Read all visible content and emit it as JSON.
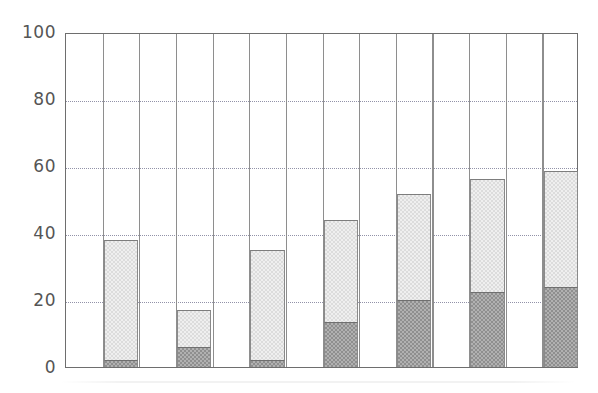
{
  "chart_data": {
    "type": "bar",
    "subtype": "stacked-vertical",
    "title": "",
    "subtitle": "",
    "xlabel": "",
    "ylabel": "",
    "categories": [
      "1",
      "2",
      "3",
      "4",
      "5",
      "6",
      "7"
    ],
    "x_tick_labels": [],
    "y_tick_labels": [
      "0",
      "20",
      "40",
      "60",
      "80",
      "100"
    ],
    "y_tick_values": [
      0,
      20,
      40,
      60,
      80,
      100
    ],
    "ylim": [
      0,
      100
    ],
    "grid": {
      "horizontal": true,
      "horizontal_style": "dotted",
      "vertical": true,
      "vertical_style": "solid",
      "vertical_separator_count": 14
    },
    "legend": {
      "visible": false,
      "position": "none",
      "entries": []
    },
    "annotations": [],
    "series": [
      {
        "name": "lower-segment",
        "color": "#8f8f8f",
        "values": [
          2,
          6,
          2,
          13.5,
          20,
          22.5,
          24
        ]
      },
      {
        "name": "upper-segment",
        "color": "#dcdcdc",
        "values": [
          36,
          11,
          33,
          30.5,
          31.5,
          33.5,
          34.5
        ]
      }
    ],
    "totals": [
      38,
      17,
      35,
      44,
      51.5,
      56,
      58.5
    ]
  },
  "colors": {
    "axis": "#6e6e6e",
    "gridline": "#7f7f9a",
    "separator": "#8e8e8e",
    "tick_label": "#555555",
    "segment_light": "#dcdcdc",
    "segment_dark": "#8f8f8f",
    "background": "#ffffff"
  }
}
